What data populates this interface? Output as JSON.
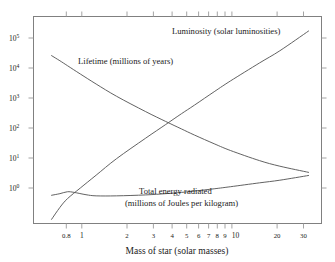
{
  "chart_data": {
    "type": "line",
    "title": "",
    "xlabel": "Mass of star (solar masses)",
    "ylabel": "",
    "xscale": "log",
    "yscale": "log",
    "xlim": [
      0.62,
      36
    ],
    "ylim": [
      0.18,
      300000
    ],
    "grid": false,
    "legend_position": "inline-annotations",
    "xticks": [
      0.8,
      1,
      2,
      3,
      4,
      5,
      6,
      7,
      8,
      9,
      10,
      20,
      30
    ],
    "xtick_labels": [
      "0.8",
      "1",
      "2",
      "3",
      "4",
      "5",
      "6",
      "7",
      "8",
      "9",
      "10",
      "20",
      "30"
    ],
    "yticks": [
      1,
      10,
      100,
      1000,
      10000,
      100000
    ],
    "ytick_labels": [
      "10⁰",
      "10¹",
      "10²",
      "10³",
      "10⁴",
      "10⁵"
    ],
    "ytick_mantissas": [
      "10",
      "10",
      "10",
      "10",
      "10",
      "10"
    ],
    "ytick_exponents": [
      "0",
      "1",
      "2",
      "3",
      "4",
      "5"
    ],
    "series": [
      {
        "name": "Luminosity (solar luminosities)",
        "label": "Luminosity (solar luminosities)",
        "x": [
          0.8,
          0.9,
          1.0,
          1.2,
          1.5,
          2.0,
          3.0,
          4.0,
          5.0,
          6.0,
          8.0,
          10.0,
          15.0,
          20.0,
          30.0
        ],
        "y": [
          0.24,
          0.55,
          1.0,
          2.1,
          5.1,
          16.0,
          65.0,
          170.0,
          360.0,
          650.0,
          1700.0,
          3500.0,
          12000.0,
          28000.0,
          110000.0
        ]
      },
      {
        "name": "Lifetime (millions of years)",
        "label": "Lifetime (millions of years)",
        "x": [
          0.8,
          0.9,
          1.0,
          1.2,
          1.5,
          2.0,
          3.0,
          4.0,
          5.0,
          6.0,
          8.0,
          10.0,
          15.0,
          20.0,
          30.0
        ],
        "y": [
          20000.0,
          14000.0,
          10000.0,
          5600.0,
          2800.0,
          1200.0,
          420.0,
          210.0,
          125.0,
          82.0,
          44.0,
          28.0,
          14.0,
          9.5,
          6.2
        ]
      },
      {
        "name": "Total energy radiated (millions of Joules per kilogram)",
        "label_line1": "Total energy radiated",
        "label_line2": "(millions of Joules per kilogram)",
        "x": [
          0.8,
          0.9,
          1.0,
          1.1,
          1.3,
          1.5,
          2.0,
          3.0,
          4.0,
          5.0,
          6.0,
          8.0,
          10.0,
          15.0,
          20.0,
          30.0
        ],
        "y": [
          1.27,
          1.42,
          1.62,
          1.55,
          1.32,
          1.22,
          1.22,
          1.3,
          1.42,
          1.55,
          1.7,
          2.0,
          2.3,
          3.0,
          3.6,
          5.0
        ]
      }
    ]
  },
  "colors": {
    "background": "#ffffff",
    "frame": "#808080",
    "curve": "#5a5a5a",
    "text": "#1a1a1a"
  }
}
